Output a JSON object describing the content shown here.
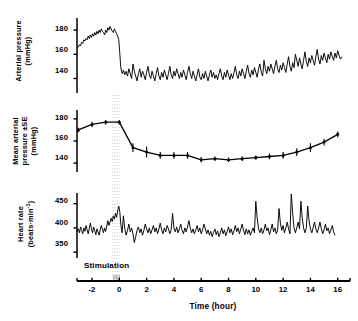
{
  "figure": {
    "background": "#ffffff",
    "ink_color": "#000000"
  },
  "panels": [
    {
      "id": "arterial-pressure",
      "ylabel_line1": "Arterial pressure",
      "ylabel_line2": "(mmHg)",
      "yticks": [
        180,
        160,
        140
      ],
      "ylim": [
        128,
        190
      ],
      "plot_box": {
        "x": 77,
        "y": 18,
        "w": 273,
        "h": 75
      }
    },
    {
      "id": "mean-arterial-pressure",
      "ylabel_line1": "Mean arterial",
      "ylabel_line2": "pressure ±SE",
      "ylabel_line3": "(mmHg)",
      "yticks": [
        180,
        160,
        140
      ],
      "ylim": [
        132,
        188
      ],
      "plot_box": {
        "x": 77,
        "y": 110,
        "w": 273,
        "h": 62
      }
    },
    {
      "id": "heart-rate",
      "ylabel_line1": "Heart rate",
      "ylabel_line2": "(beats·min",
      "ylabel_exp": "-1",
      "ylabel_line2_end": ")",
      "yticks": [
        450,
        400,
        350
      ],
      "ylim": [
        338,
        472
      ],
      "plot_box": {
        "x": 77,
        "y": 193,
        "w": 273,
        "h": 65
      }
    }
  ],
  "xaxis": {
    "title": "Time (hour)",
    "ticks": [
      -2,
      0,
      2,
      4,
      6,
      8,
      10,
      12,
      14,
      16
    ],
    "tick_labels": [
      "-2",
      "0",
      "2",
      "4",
      "6",
      "8",
      "10",
      "12",
      "14",
      "16"
    ],
    "xlim": [
      -3.1,
      16.9
    ],
    "axis_y": 281,
    "axis_x_start": 77,
    "axis_x_end": 350
  },
  "annotations": {
    "stimulation_label": "Stimulation",
    "stimulation_start_hour": -0.5,
    "stimulation_end_hour": 0.05
  },
  "chart_data": {
    "type": "line",
    "title": "",
    "xlabel": "Time (hour)",
    "grid": false,
    "legend": "none",
    "subplots": [
      {
        "name": "Arterial pressure",
        "ylabel": "Arterial pressure (mmHg)",
        "ylim": [
          128,
          190
        ],
        "yticks": [
          140,
          160,
          180
        ],
        "style": "continuous beat-averaged trace",
        "x": [
          -3.1,
          -3.0,
          -2.92,
          -2.84,
          -2.76,
          -2.68,
          -2.6,
          -2.52,
          -2.44,
          -2.36,
          -2.28,
          -2.2,
          -2.12,
          -2.04,
          -1.96,
          -1.88,
          -1.8,
          -1.72,
          -1.64,
          -1.56,
          -1.48,
          -1.4,
          -1.32,
          -1.24,
          -1.16,
          -1.08,
          -1.0,
          -0.92,
          -0.84,
          -0.76,
          -0.68,
          -0.6,
          -0.52,
          -0.44,
          -0.36,
          -0.28,
          -0.2,
          -0.12,
          -0.04,
          0.04,
          0.1,
          0.16,
          0.22,
          0.3,
          0.4,
          0.5,
          0.6,
          0.7,
          0.8,
          0.9,
          1.0,
          1.1,
          1.2,
          1.3,
          1.4,
          1.5,
          1.6,
          1.7,
          1.8,
          1.9,
          2.0,
          2.1,
          2.2,
          2.3,
          2.4,
          2.5,
          2.6,
          2.7,
          2.8,
          2.9,
          3.0,
          3.1,
          3.2,
          3.3,
          3.4,
          3.5,
          3.6,
          3.7,
          3.8,
          3.9,
          4.0,
          4.1,
          4.2,
          4.3,
          4.4,
          4.5,
          4.6,
          4.7,
          4.8,
          4.9,
          5.0,
          5.1,
          5.2,
          5.3,
          5.4,
          5.5,
          5.6,
          5.7,
          5.8,
          5.9,
          6.0,
          6.1,
          6.2,
          6.3,
          6.4,
          6.5,
          6.6,
          6.7,
          6.8,
          6.9,
          7.0,
          7.1,
          7.2,
          7.3,
          7.4,
          7.5,
          7.6,
          7.7,
          7.8,
          7.9,
          8.0,
          8.1,
          8.2,
          8.3,
          8.4,
          8.5,
          8.6,
          8.7,
          8.8,
          8.9,
          9.0,
          9.1,
          9.2,
          9.3,
          9.4,
          9.5,
          9.6,
          9.7,
          9.8,
          9.9,
          10.0,
          10.1,
          10.2,
          10.3,
          10.4,
          10.5,
          10.6,
          10.7,
          10.8,
          10.9,
          11.0,
          11.1,
          11.2,
          11.3,
          11.4,
          11.5,
          11.6,
          11.7,
          11.8,
          11.9,
          12.0,
          12.1,
          12.2,
          12.3,
          12.4,
          12.5,
          12.6,
          12.7,
          12.8,
          12.9,
          13.0,
          13.1,
          13.2,
          13.3,
          13.4,
          13.5,
          13.6,
          13.7,
          13.8,
          13.9,
          14.0,
          14.1,
          14.2,
          14.3,
          14.4,
          14.5,
          14.6,
          14.7,
          14.8,
          14.9,
          15.0,
          15.1,
          15.2,
          15.3,
          15.4,
          15.5,
          15.6,
          15.7,
          15.8,
          15.9,
          16.0,
          16.1,
          16.2,
          16.3
        ],
        "y": [
          165,
          166,
          168,
          167,
          170,
          169,
          172,
          171,
          173,
          172,
          175,
          173,
          176,
          174,
          177,
          175,
          178,
          176,
          179,
          177,
          180,
          178,
          181,
          179,
          178,
          176,
          180,
          178,
          182,
          180,
          183,
          181,
          179,
          178,
          181,
          179,
          177,
          175,
          172,
          160,
          150,
          146,
          144,
          147,
          143,
          146,
          142,
          148,
          144,
          140,
          152,
          146,
          142,
          138,
          144,
          148,
          141,
          146,
          143,
          139,
          145,
          150,
          143,
          140,
          146,
          142,
          138,
          144,
          149,
          142,
          139,
          145,
          141,
          147,
          143,
          139,
          144,
          150,
          143,
          140,
          146,
          142,
          148,
          144,
          140,
          145,
          141,
          147,
          143,
          139,
          145,
          150,
          144,
          140,
          146,
          142,
          138,
          143,
          148,
          141,
          139,
          144,
          140,
          146,
          142,
          138,
          143,
          147,
          141,
          145,
          140,
          143,
          139,
          144,
          148,
          142,
          139,
          145,
          141,
          147,
          143,
          139,
          144,
          140,
          145,
          150,
          143,
          140,
          146,
          142,
          148,
          144,
          140,
          146,
          151,
          144,
          141,
          147,
          143,
          149,
          145,
          141,
          148,
          152,
          145,
          142,
          155,
          148,
          144,
          150,
          146,
          152,
          148,
          144,
          150,
          155,
          148,
          145,
          151,
          147,
          153,
          149,
          145,
          152,
          158,
          150,
          146,
          153,
          149,
          160,
          155,
          150,
          157,
          152,
          148,
          155,
          162,
          154,
          150,
          157,
          153,
          159,
          155,
          151,
          158,
          164,
          156,
          152,
          159,
          155,
          161,
          157,
          153,
          160,
          156,
          162,
          158,
          155,
          161,
          157,
          163,
          159,
          156,
          158
        ]
      },
      {
        "name": "Mean arterial pressure ±SE",
        "ylabel": "Mean arterial pressure ±SE (mmHg)",
        "ylim": [
          132,
          188
        ],
        "yticks": [
          140,
          160,
          180
        ],
        "style": "hourly means with SE error bars, filled circles",
        "x": [
          -3,
          -2,
          -1,
          0,
          1,
          2,
          3,
          4,
          5,
          6,
          7,
          8,
          9,
          10,
          11,
          12,
          13,
          14,
          15,
          16
        ],
        "y": [
          170,
          175,
          177,
          177,
          154,
          150,
          147,
          147,
          147,
          143,
          144,
          143,
          144,
          145,
          146,
          147,
          150,
          154,
          159,
          166
        ],
        "yerr": [
          2.0,
          2.5,
          2.0,
          2.0,
          4.0,
          5.0,
          3.0,
          3.0,
          3.0,
          2.5,
          2.0,
          2.0,
          2.0,
          2.0,
          2.5,
          3.0,
          3.5,
          4.0,
          3.0,
          2.5
        ]
      },
      {
        "name": "Heart rate",
        "ylabel": "Heart rate (beats·min⁻¹)",
        "ylim": [
          338,
          472
        ],
        "yticks": [
          350,
          400,
          450
        ],
        "style": "continuous trace with spikes",
        "x": [
          -3.1,
          -3.0,
          -2.92,
          -2.84,
          -2.76,
          -2.68,
          -2.6,
          -2.52,
          -2.44,
          -2.36,
          -2.28,
          -2.2,
          -2.12,
          -2.04,
          -1.96,
          -1.88,
          -1.8,
          -1.72,
          -1.64,
          -1.56,
          -1.48,
          -1.4,
          -1.32,
          -1.24,
          -1.16,
          -1.08,
          -1.0,
          -0.92,
          -0.84,
          -0.76,
          -0.68,
          -0.6,
          -0.52,
          -0.44,
          -0.36,
          -0.28,
          -0.2,
          -0.12,
          -0.04,
          0.04,
          0.12,
          0.2,
          0.3,
          0.4,
          0.5,
          0.6,
          0.7,
          0.8,
          0.9,
          1.0,
          1.1,
          1.2,
          1.3,
          1.4,
          1.5,
          1.6,
          1.7,
          1.8,
          1.9,
          2.0,
          2.1,
          2.2,
          2.3,
          2.4,
          2.5,
          2.6,
          2.7,
          2.8,
          2.9,
          3.0,
          3.1,
          3.2,
          3.3,
          3.4,
          3.5,
          3.6,
          3.7,
          3.8,
          3.9,
          4.0,
          4.1,
          4.2,
          4.3,
          4.4,
          4.5,
          4.6,
          4.7,
          4.8,
          4.9,
          5.0,
          5.1,
          5.2,
          5.3,
          5.4,
          5.5,
          5.6,
          5.7,
          5.8,
          5.9,
          6.0,
          6.1,
          6.2,
          6.3,
          6.4,
          6.5,
          6.6,
          6.7,
          6.8,
          6.9,
          7.0,
          7.1,
          7.2,
          7.3,
          7.4,
          7.5,
          7.6,
          7.7,
          7.8,
          7.9,
          8.0,
          8.1,
          8.2,
          8.3,
          8.4,
          8.5,
          8.6,
          8.7,
          8.8,
          8.9,
          9.0,
          9.1,
          9.2,
          9.3,
          9.4,
          9.5,
          9.6,
          9.7,
          9.8,
          9.9,
          10.0,
          10.1,
          10.2,
          10.3,
          10.4,
          10.5,
          10.6,
          10.7,
          10.8,
          10.9,
          11.0,
          11.1,
          11.2,
          11.3,
          11.4,
          11.5,
          11.6,
          11.7,
          11.8,
          11.9,
          12.0,
          12.1,
          12.2,
          12.3,
          12.4,
          12.5,
          12.6,
          12.7,
          12.8,
          12.9,
          13.0,
          13.1,
          13.2,
          13.3,
          13.4,
          13.5,
          13.6,
          13.7,
          13.8,
          13.9,
          14.0,
          14.1,
          14.2,
          14.3,
          14.4,
          14.5,
          14.6,
          14.7,
          14.8,
          14.9,
          15.0,
          15.1,
          15.2,
          15.3,
          15.4,
          15.5,
          15.6,
          15.7,
          15.8,
          15.9,
          16.0,
          16.1,
          16.2,
          16.3
        ],
        "y": [
          392,
          398,
          390,
          402,
          395,
          388,
          400,
          393,
          405,
          396,
          388,
          399,
          410,
          398,
          390,
          402,
          394,
          386,
          398,
          392,
          385,
          396,
          405,
          398,
          390,
          400,
          393,
          404,
          415,
          405,
          412,
          420,
          413,
          425,
          418,
          430,
          422,
          435,
          445,
          432,
          405,
          390,
          425,
          398,
          385,
          395,
          408,
          392,
          400,
          388,
          370,
          382,
          395,
          402,
          390,
          398,
          385,
          395,
          408,
          398,
          390,
          400,
          388,
          396,
          405,
          392,
          400,
          388,
          398,
          410,
          396,
          388,
          400,
          392,
          405,
          398,
          388,
          396,
          430,
          400,
          392,
          402,
          390,
          398,
          408,
          395,
          388,
          400,
          392,
          402,
          415,
          400,
          390,
          398,
          388,
          396,
          405,
          392,
          400,
          388,
          396,
          408,
          398,
          388,
          396,
          385,
          393,
          382,
          390,
          398,
          386,
          394,
          382,
          390,
          400,
          388,
          396,
          384,
          392,
          402,
          390,
          398,
          386,
          394,
          405,
          392,
          400,
          388,
          398,
          408,
          395,
          386,
          398,
          388,
          396,
          385,
          393,
          400,
          390,
          455,
          420,
          398,
          390,
          400,
          388,
          396,
          408,
          394,
          400,
          386,
          396,
          408,
          392,
          400,
          388,
          396,
          440,
          410,
          395,
          405,
          390,
          400,
          412,
          398,
          388,
          470,
          430,
          400,
          390,
          400,
          412,
          398,
          455,
          420,
          400,
          390,
          400,
          445,
          415,
          398,
          390,
          400,
          412,
          398,
          390,
          400,
          412,
          398,
          388,
          396,
          408,
          394,
          400,
          388,
          396,
          405,
          392,
          385
        ]
      }
    ]
  }
}
